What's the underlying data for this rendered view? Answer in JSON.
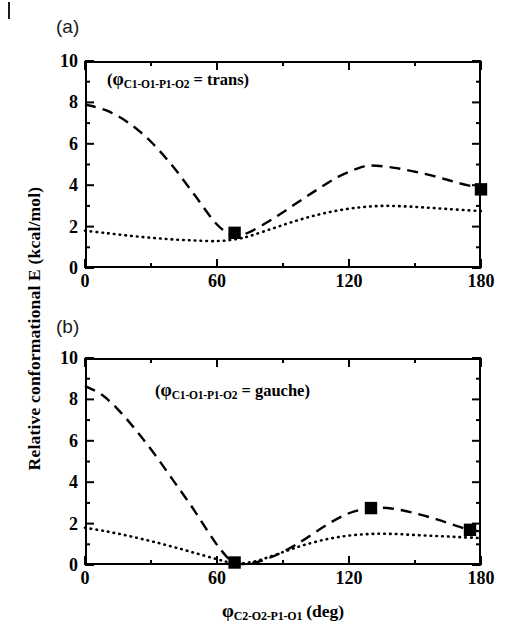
{
  "figure": {
    "panel_a_tag": "(a)",
    "panel_b_tag": "(b)",
    "y_axis_title": "Relative conformational E (kcal/mol)",
    "x_axis_phi": "φ",
    "x_axis_subscript": "C2-O2-P1-O1",
    "x_axis_units": "(deg)",
    "line_color": "#000000"
  },
  "chart_data": [
    {
      "type": "line",
      "panel": "(a)",
      "title": "",
      "annotation": "(φC1-O1-P1-O2 = trans)",
      "annotation_phi": "φ",
      "annotation_subscript": "C1-O1-P1-O2",
      "annotation_tail": " = trans)",
      "annotation_head": "(",
      "xlabel": "φC2-O2-P1-O1 (deg)",
      "ylabel": "Relative conformational E (kcal/mol)",
      "xlim": [
        0,
        180
      ],
      "ylim": [
        0,
        10
      ],
      "xticks": [
        0,
        60,
        120,
        180
      ],
      "xtick_labels": [
        "0",
        "60",
        "120",
        "180"
      ],
      "xminorticks": [
        30,
        90,
        150
      ],
      "yticks": [
        0,
        2,
        4,
        6,
        8,
        10
      ],
      "ytick_labels": [
        "0",
        "2",
        "4",
        "6",
        "8",
        "10"
      ],
      "yminorticks": [
        1,
        3,
        5,
        7,
        9
      ],
      "grid": false,
      "legend": "none",
      "series": [
        {
          "name": "dashed-curve",
          "style": "dashed",
          "x": [
            0,
            10,
            20,
            30,
            40,
            50,
            60,
            68,
            75,
            85,
            95,
            105,
            115,
            125,
            130,
            140,
            150,
            160,
            170,
            180
          ],
          "values": [
            7.9,
            7.6,
            7.0,
            6.1,
            4.9,
            3.5,
            2.1,
            1.55,
            1.75,
            2.35,
            3.05,
            3.75,
            4.4,
            4.85,
            4.95,
            4.85,
            4.65,
            4.4,
            4.1,
            3.85
          ]
        },
        {
          "name": "dotted-curve",
          "style": "dotted",
          "x": [
            0,
            10,
            20,
            30,
            40,
            50,
            60,
            68,
            75,
            85,
            95,
            105,
            115,
            125,
            135,
            145,
            155,
            165,
            175,
            180
          ],
          "values": [
            1.8,
            1.68,
            1.56,
            1.46,
            1.38,
            1.33,
            1.3,
            1.38,
            1.55,
            1.9,
            2.25,
            2.55,
            2.78,
            2.93,
            3.0,
            2.98,
            2.92,
            2.85,
            2.78,
            2.75
          ]
        }
      ],
      "markers": [
        {
          "x": 68,
          "y": 1.7,
          "shape": "square"
        },
        {
          "x": 180,
          "y": 3.8,
          "shape": "square"
        }
      ]
    },
    {
      "type": "line",
      "panel": "(b)",
      "title": "",
      "annotation": "(φC1-O1-P1-O2 = gauche)",
      "annotation_phi": "φ",
      "annotation_subscript": "C1-O1-P1-O2",
      "annotation_tail": " = gauche)",
      "annotation_head": "(",
      "xlabel": "φC2-O2-P1-O1 (deg)",
      "ylabel": "Relative conformational E (kcal/mol)",
      "xlim": [
        0,
        180
      ],
      "ylim": [
        0,
        10
      ],
      "xticks": [
        0,
        60,
        120,
        180
      ],
      "xtick_labels": [
        "0",
        "60",
        "120",
        "180"
      ],
      "xminorticks": [
        30,
        90,
        150
      ],
      "yticks": [
        0,
        2,
        4,
        6,
        8,
        10
      ],
      "ytick_labels": [
        "0",
        "2",
        "4",
        "6",
        "8",
        "10"
      ],
      "yminorticks": [
        1,
        3,
        5,
        7,
        9
      ],
      "grid": false,
      "legend": "none",
      "series": [
        {
          "name": "dashed-curve",
          "style": "dashed",
          "x": [
            0,
            8,
            16,
            24,
            32,
            40,
            48,
            56,
            62,
            68,
            76,
            84,
            92,
            100,
            110,
            120,
            130,
            140,
            150,
            160,
            170,
            175,
            180
          ],
          "values": [
            8.65,
            8.2,
            7.4,
            6.4,
            5.3,
            4.1,
            2.9,
            1.6,
            0.7,
            0.1,
            0.1,
            0.35,
            0.75,
            1.25,
            1.95,
            2.5,
            2.75,
            2.72,
            2.5,
            2.2,
            1.85,
            1.7,
            1.62
          ]
        },
        {
          "name": "dotted-curve",
          "style": "dotted",
          "x": [
            0,
            10,
            20,
            30,
            40,
            50,
            60,
            68,
            76,
            84,
            92,
            100,
            110,
            120,
            130,
            140,
            150,
            160,
            170,
            180
          ],
          "values": [
            1.8,
            1.62,
            1.4,
            1.15,
            0.88,
            0.58,
            0.28,
            0.08,
            0.15,
            0.4,
            0.7,
            0.98,
            1.25,
            1.42,
            1.5,
            1.5,
            1.45,
            1.4,
            1.35,
            1.3
          ]
        }
      ],
      "markers": [
        {
          "x": 68,
          "y": 0.12,
          "shape": "square"
        },
        {
          "x": 130,
          "y": 2.75,
          "shape": "square"
        },
        {
          "x": 175,
          "y": 1.7,
          "shape": "square"
        }
      ]
    }
  ]
}
